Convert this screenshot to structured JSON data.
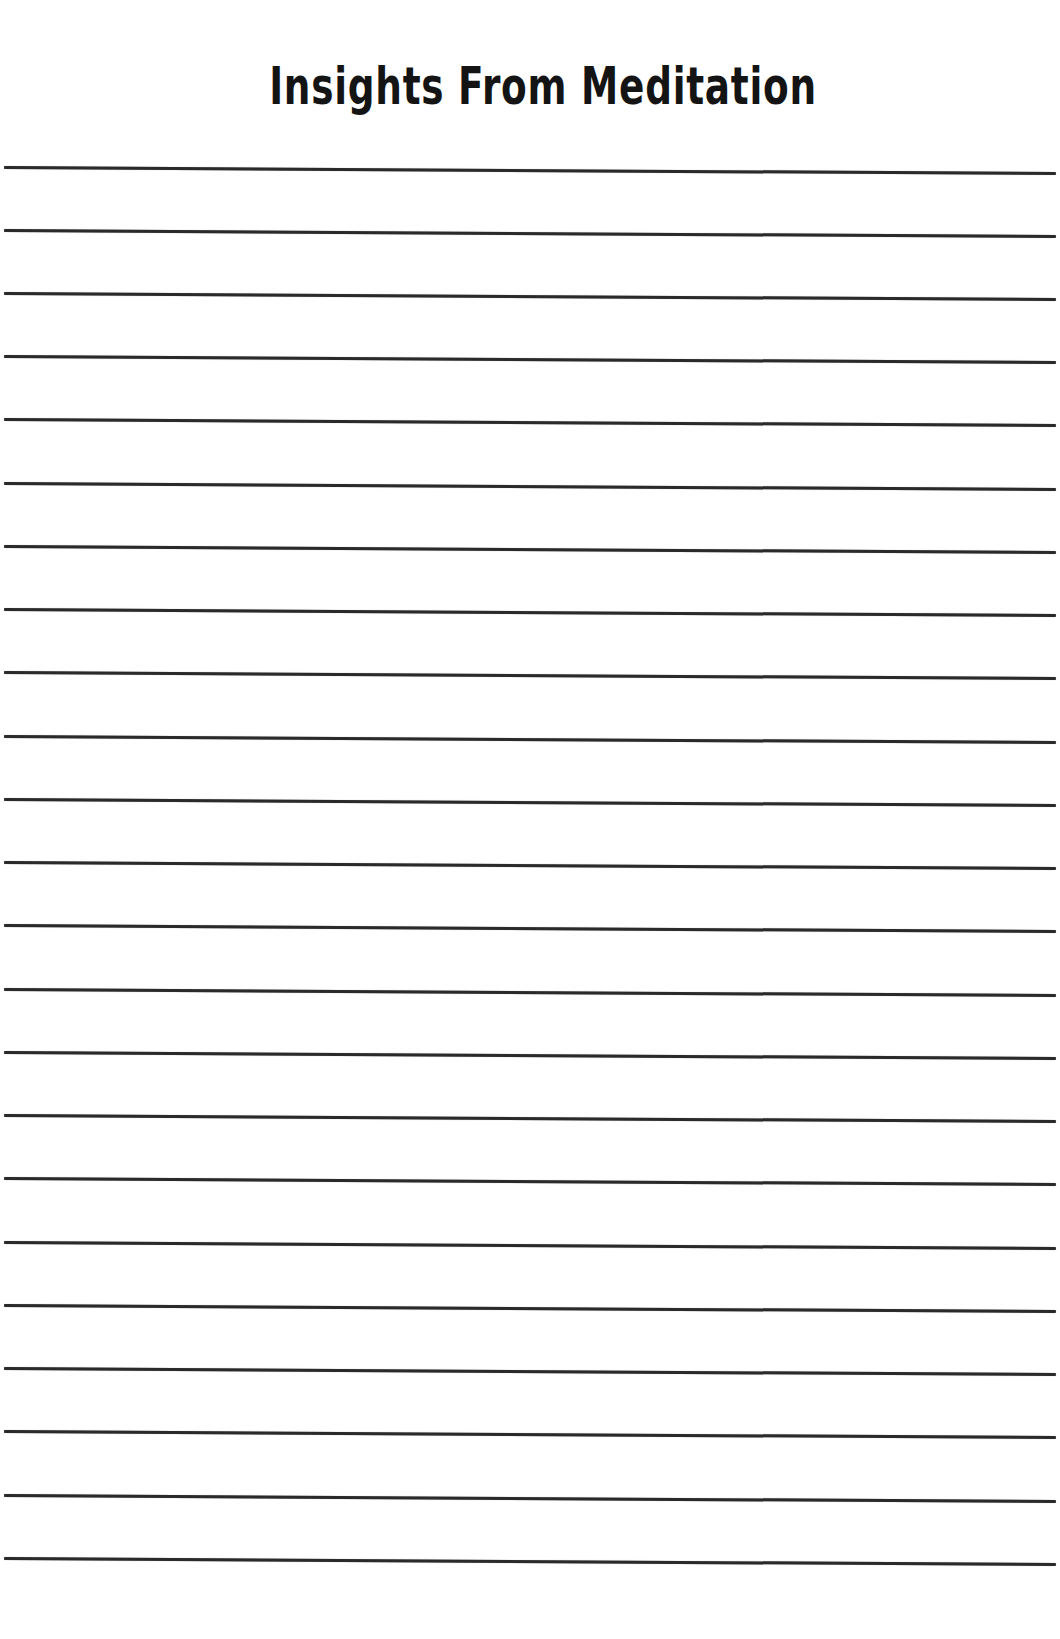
{
  "page": {
    "title": "Insights From Meditation",
    "background_color": "#ffffff",
    "text_color": "#141414",
    "line_color": "#2a2a2a",
    "ruled_lines": {
      "count": 23,
      "first_y": 166,
      "spacing": 63.2,
      "positions_y": [
        166,
        229,
        292,
        355,
        418,
        482,
        545,
        608,
        671,
        735,
        798,
        861,
        924,
        988,
        1051,
        1114,
        1177,
        1241,
        1304,
        1367,
        1430,
        1494,
        1557
      ]
    }
  }
}
